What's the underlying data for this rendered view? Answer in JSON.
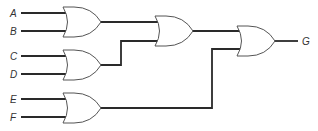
{
  "diagram": {
    "type": "logic-circuit",
    "gate_type": "OR",
    "inputs": [
      {
        "label": "A",
        "y": 13
      },
      {
        "label": "B",
        "y": 31
      },
      {
        "label": "C",
        "y": 56
      },
      {
        "label": "D",
        "y": 74
      },
      {
        "label": "E",
        "y": 99
      },
      {
        "label": "F",
        "y": 117
      }
    ],
    "output": {
      "label": "G",
      "y": 41
    },
    "gates": [
      {
        "id": "or1",
        "inputs": [
          "A",
          "B"
        ]
      },
      {
        "id": "or2",
        "inputs": [
          "C",
          "D"
        ]
      },
      {
        "id": "or3",
        "inputs": [
          "E",
          "F"
        ]
      },
      {
        "id": "or4",
        "inputs": [
          "or1",
          "or2"
        ]
      },
      {
        "id": "or5",
        "inputs": [
          "or4",
          "or3"
        ],
        "output": "G"
      }
    ],
    "colors": {
      "wire": "#2a2a2a",
      "gate_outline": "#555555",
      "background": "#ffffff"
    }
  }
}
